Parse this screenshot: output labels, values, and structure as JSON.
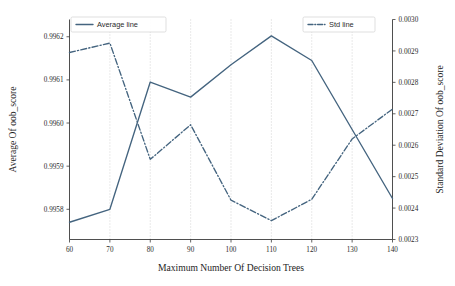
{
  "chart_data": {
    "type": "line",
    "title": "",
    "xlabel": "Maximum Number Of Decision Trees",
    "ylabel": "Average Of oob_score",
    "ylabel_right": "Standard Deviation Of oob_score",
    "x": [
      60,
      70,
      80,
      90,
      100,
      110,
      120,
      130,
      140
    ],
    "xlim": [
      60,
      140
    ],
    "ylim": [
      0.99573,
      0.99624
    ],
    "ylim_right": [
      0.0023,
      0.003
    ],
    "xticks": [
      "60",
      "70",
      "80",
      "90",
      "100",
      "110",
      "120",
      "130",
      "140"
    ],
    "yticks_left": [
      "0.9958",
      "0.9959",
      "0.9960",
      "0.9961",
      "0.9962"
    ],
    "yticks_left_values": [
      0.9958,
      0.9959,
      0.996,
      0.9961,
      0.9962
    ],
    "yticks_right": [
      "0.0023",
      "0.0024",
      "0.0025",
      "0.0026",
      "0.0027",
      "0.0028",
      "0.0029",
      "0.0030"
    ],
    "yticks_right_values": [
      0.0023,
      0.0024,
      0.0025,
      0.0026,
      0.0027,
      0.0028,
      0.0029,
      0.003
    ],
    "grid": "vertical-dotted",
    "legend_position": "upper-left and upper-right",
    "series": [
      {
        "name": "Average line",
        "axis": "left",
        "style": "solid",
        "color": "#44647f",
        "values": [
          0.99577,
          0.9958,
          0.996095,
          0.99606,
          0.996135,
          0.996202,
          0.996145,
          0.995985,
          0.995825
        ]
      },
      {
        "name": "Std line",
        "axis": "right",
        "style": "dashdot",
        "color": "#44647f",
        "values": [
          0.002895,
          0.002925,
          0.002555,
          0.002665,
          0.002425,
          0.00236,
          0.002428,
          0.00262,
          0.002715
        ]
      }
    ]
  },
  "legend": {
    "left_entry": "Average line",
    "right_entry": "Std line"
  },
  "colors": {
    "series": "#44647f",
    "axis": "#3b3b3b",
    "grid": "#b9b9b9",
    "background": "#ffffff"
  }
}
